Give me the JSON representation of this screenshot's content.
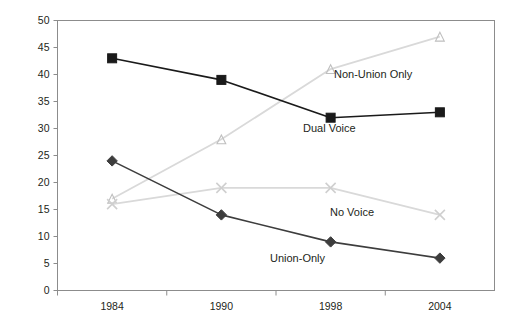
{
  "chart_data": {
    "type": "line",
    "title": "",
    "subtitle": "",
    "xlabel": "",
    "ylabel": "",
    "categories": [
      "1984",
      "1990",
      "1998",
      "2004"
    ],
    "ylim": [
      0,
      50
    ],
    "yticks": [
      0,
      5,
      10,
      15,
      20,
      25,
      30,
      35,
      40,
      45,
      50
    ],
    "grid": false,
    "legend_position": "inline-labels",
    "series": [
      {
        "name": "Dual Voice",
        "values": [
          43,
          39,
          32,
          33
        ],
        "color": "#1a1a1a",
        "marker": "filled-square",
        "label_anchor": {
          "x": 303,
          "y": 132
        },
        "label_align": "start"
      },
      {
        "name": "Union-Only",
        "values": [
          24,
          14,
          9,
          6
        ],
        "color": "#3d3d3d",
        "marker": "filled-diamond",
        "label_anchor": {
          "x": 270,
          "y": 262
        },
        "label_align": "start"
      },
      {
        "name": "Non-Union Only",
        "values": [
          17,
          28,
          41,
          47
        ],
        "color": "#d9d9d9",
        "marker": "open-triangle",
        "label_anchor": {
          "x": 334,
          "y": 78
        },
        "label_align": "start"
      },
      {
        "name": "No Voice",
        "values": [
          16,
          19,
          19,
          14
        ],
        "color": "#d9d9d9",
        "marker": "cross-x",
        "label_anchor": {
          "x": 330,
          "y": 216
        },
        "label_align": "start"
      }
    ]
  },
  "axis": {
    "y_tick_labels": [
      "50",
      "45",
      "40",
      "35",
      "30",
      "25",
      "20",
      "15",
      "10",
      "5",
      "0"
    ],
    "x_tick_labels": [
      "1984",
      "1990",
      "1998",
      "2004"
    ]
  },
  "colors": {
    "frame": "#8c8c8c",
    "axis_text": "#231f20",
    "dark_series": "#1a1a1a",
    "mid_series": "#3d3d3d",
    "light_series": "#d9d9d9",
    "background": "#ffffff"
  }
}
